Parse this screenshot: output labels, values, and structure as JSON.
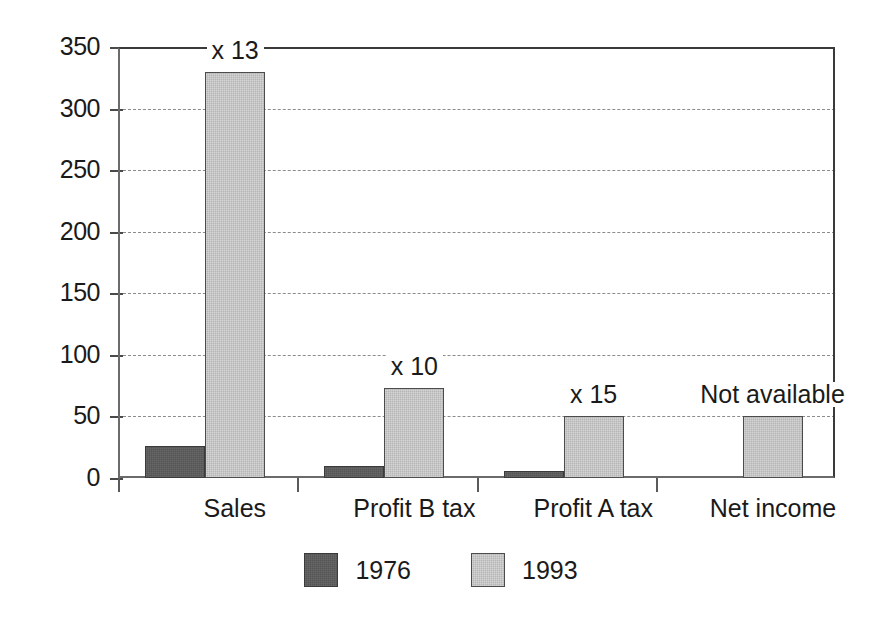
{
  "chart_data": {
    "type": "bar",
    "title": "",
    "subtitle": "",
    "xlabel": "",
    "ylabel": "",
    "ylim": [
      0,
      350
    ],
    "yticks": [
      0,
      50,
      100,
      150,
      200,
      250,
      300,
      350
    ],
    "ytick_labels": [
      "0",
      "50",
      "100",
      "150",
      "200",
      "250",
      "300",
      "350"
    ],
    "grid": "horizontal-dashed",
    "legend_position": "bottom-center",
    "categories": [
      "Sales",
      "Profit B tax",
      "Profit A tax",
      "Net income"
    ],
    "series": [
      {
        "name": "1976",
        "color": "#555555",
        "values": [
          26,
          10,
          6,
          null
        ]
      },
      {
        "name": "1993",
        "color": "#b6b6b6",
        "values": [
          330,
          73,
          50,
          50
        ]
      }
    ],
    "annotations": [
      {
        "category": "Sales",
        "text": "x 13"
      },
      {
        "category": "Profit B tax",
        "text": "x 10"
      },
      {
        "category": "Profit A tax",
        "text": "x 15"
      },
      {
        "category": "Net income",
        "text": "Not available"
      }
    ]
  },
  "axis": {
    "y": {
      "ticks": [
        {
          "label": "350",
          "value": 350
        },
        {
          "label": "300",
          "value": 300
        },
        {
          "label": "250",
          "value": 250
        },
        {
          "label": "200",
          "value": 200
        },
        {
          "label": "150",
          "value": 150
        },
        {
          "label": "100",
          "value": 100
        },
        {
          "label": "50",
          "value": 50
        },
        {
          "label": "0",
          "value": 0
        }
      ]
    },
    "x": {
      "categories": [
        {
          "label": "Sales"
        },
        {
          "label": "Profit B tax"
        },
        {
          "label": "Profit A tax"
        },
        {
          "label": "Net income"
        }
      ]
    }
  },
  "legend": {
    "items": [
      {
        "label": "1976",
        "color": "#555555"
      },
      {
        "label": "1993",
        "color": "#b6b6b6"
      }
    ]
  },
  "colors": {
    "series_1976": "#555555",
    "series_1993": "#b6b6b6",
    "axis": "#3a3a3a",
    "grid": "#8c8c8c",
    "text": "#1a1a1a",
    "background": "#ffffff"
  }
}
